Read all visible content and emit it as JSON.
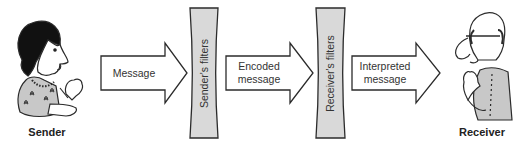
{
  "diagram": {
    "colors": {
      "stroke": "#2b2b2b",
      "filter_fill": "#d9d9d9",
      "arrow_fill": "#ffffff",
      "text": "#333333"
    },
    "nodes": {
      "sender": {
        "label": "Sender"
      },
      "senders_filter": {
        "label": "Sender's filters"
      },
      "receivers_filter": {
        "label": "Receiver's filters"
      },
      "receiver": {
        "label": "Receiver"
      }
    },
    "arrows": [
      {
        "id": "message",
        "label_line1": "Message",
        "label_line2": ""
      },
      {
        "id": "encoded",
        "label_line1": "Encoded",
        "label_line2": "message"
      },
      {
        "id": "interpreted",
        "label_line1": "Interpreted",
        "label_line2": "message"
      }
    ],
    "flow": [
      "Sender",
      "Message",
      "Sender's filters",
      "Encoded message",
      "Receiver's filters",
      "Interpreted message",
      "Receiver"
    ]
  }
}
